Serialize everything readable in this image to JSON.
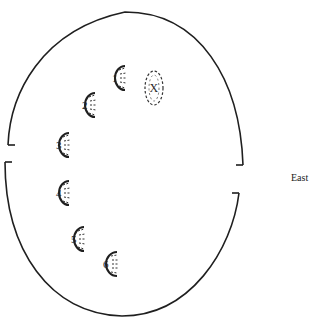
{
  "diagram": {
    "direction_label": "East",
    "enclosure": {
      "shape": "ellipse",
      "openings": [
        "west",
        "east"
      ]
    },
    "footprints": [
      {
        "label": "1",
        "x": 116,
        "y": 78
      },
      {
        "label": "2",
        "x": 86,
        "y": 105
      },
      {
        "label": "3",
        "x": 60,
        "y": 145
      },
      {
        "label": "4",
        "x": 60,
        "y": 193
      },
      {
        "label": "5",
        "x": 75,
        "y": 239
      },
      {
        "label": "6",
        "x": 107,
        "y": 264
      }
    ],
    "target": {
      "label": "X",
      "x": 154,
      "y": 88
    }
  }
}
